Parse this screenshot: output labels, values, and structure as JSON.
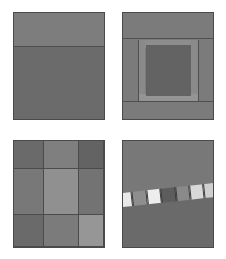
{
  "figure": {
    "background_color": "#ffffff",
    "layout": "2x2 grid of rectangular panels",
    "panel_border_color": "#4a4a4a",
    "panels": [
      {
        "id": "panel-top-left",
        "label": "Two-band horizontal split",
        "x": 13,
        "y": 12,
        "width": 92,
        "height": 108,
        "background_color": "#6e6e6e",
        "regions": [
          {
            "name": "upper-band",
            "color": "#7d7d7d",
            "top_pct": 0,
            "height_pct": 31
          },
          {
            "name": "lower-band",
            "color": "#6b6b6b",
            "top_pct": 31,
            "height_pct": 69
          },
          {
            "name": "divider-line",
            "color": "#4f4f4f",
            "top_pct": 31,
            "height_pct": 1
          }
        ]
      },
      {
        "id": "panel-top-right",
        "label": "Nested frame with bright inner border",
        "x": 122,
        "y": 12,
        "width": 92,
        "height": 108,
        "background_color": "#7b7b7b",
        "regions": [
          {
            "name": "outer-field",
            "color": "#7b7b7b"
          },
          {
            "name": "top-header-band",
            "color": "#7b7b7b",
            "top_pct": 0,
            "height_pct": 24
          },
          {
            "name": "header-divider",
            "color": "#4f4f4f",
            "top_pct": 24,
            "height_pct": 1
          },
          {
            "name": "frame-top-bar",
            "color": "#8d8d8d",
            "left_pct": 17,
            "top_pct": 25,
            "width_pct": 66,
            "height_pct": 8
          },
          {
            "name": "frame-left-pillar",
            "color": "#8a8a8a",
            "left_pct": 17,
            "top_pct": 25,
            "width_pct": 8,
            "height_pct": 58
          },
          {
            "name": "frame-right-pillar",
            "color": "#8a8a8a",
            "left_pct": 75,
            "top_pct": 25,
            "width_pct": 8,
            "height_pct": 58
          },
          {
            "name": "frame-bottom-bar",
            "color": "#949494",
            "left_pct": 17,
            "top_pct": 76,
            "width_pct": 66,
            "height_pct": 7
          },
          {
            "name": "inner-core",
            "color": "#636363",
            "left_pct": 25,
            "top_pct": 30,
            "width_pct": 50,
            "height_pct": 48
          },
          {
            "name": "footer-divider",
            "color": "#4f4f4f",
            "top_pct": 83,
            "height_pct": 1
          },
          {
            "name": "bottom-band",
            "color": "#7b7b7b",
            "top_pct": 84,
            "height_pct": 16
          }
        ]
      },
      {
        "id": "panel-bottom-left",
        "label": "Three by three tonal grid",
        "x": 13,
        "y": 140,
        "width": 92,
        "height": 108,
        "background_color": "#767676",
        "grid": {
          "rows": 3,
          "columns": 3,
          "row_heights_pct": [
            26,
            44,
            30
          ],
          "column_widths_pct": [
            33,
            39,
            28
          ],
          "gridline_color": "#4b4b4b",
          "cells": [
            {
              "row": 0,
              "col": 0,
              "color": "#6a6a6a"
            },
            {
              "row": 0,
              "col": 1,
              "color": "#7f7f7f"
            },
            {
              "row": 0,
              "col": 2,
              "color": "#636363"
            },
            {
              "row": 1,
              "col": 0,
              "color": "#787878"
            },
            {
              "row": 1,
              "col": 1,
              "color": "#909090"
            },
            {
              "row": 1,
              "col": 2,
              "color": "#737373"
            },
            {
              "row": 2,
              "col": 0,
              "color": "#6a6a6a"
            },
            {
              "row": 2,
              "col": 1,
              "color": "#7b7b7b"
            },
            {
              "row": 2,
              "col": 2,
              "color": "#969696"
            }
          ]
        }
      },
      {
        "id": "panel-bottom-right",
        "label": "Diagonal segmented strip over split field",
        "x": 122,
        "y": 140,
        "width": 92,
        "height": 108,
        "background_color": "#6c6c6c",
        "regions": [
          {
            "name": "upper-field",
            "color": "#787878",
            "top_pct": 0,
            "height_pct": 50
          },
          {
            "name": "lower-field",
            "color": "#6a6a6a",
            "top_pct": 50,
            "height_pct": 50
          }
        ],
        "strip": {
          "name": "segmented-diagonal-strip",
          "angle_deg": -6.2,
          "segment_border_color": "#3c3c3c",
          "segments": [
            {
              "index": 0,
              "color": "#e9e9e9"
            },
            {
              "index": 1,
              "color": "#8e8e8e"
            },
            {
              "index": 2,
              "color": "#ededed"
            },
            {
              "index": 3,
              "color": "#5d5d5d"
            },
            {
              "index": 4,
              "color": "#8a8a8a"
            },
            {
              "index": 5,
              "color": "#d8d8d8"
            },
            {
              "index": 6,
              "color": "#cfcfcf"
            }
          ]
        }
      }
    ]
  }
}
